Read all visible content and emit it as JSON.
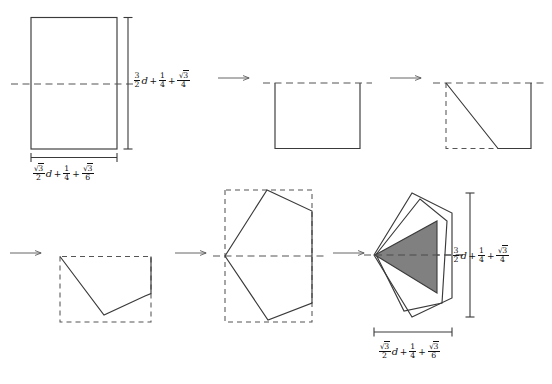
{
  "figure": {
    "domain": "diagram",
    "background_color": "#ffffff",
    "stroke_color": "#3a3a3a",
    "dashed_color": "#555555",
    "shade_color": "#808080",
    "arrow_color": "#555555",
    "step_count": 6
  },
  "labels": {
    "height_label": {
      "name": "height-dimension-label",
      "text": "3/2 d + 1/4 + sqrt(3)/4",
      "parts": {
        "f1_num": "3",
        "f1_den": "2",
        "var": "d",
        "op1": "+",
        "f2_num": "1",
        "f2_den": "4",
        "op2": "+",
        "f3_num_radical": "3",
        "f3_den": "4"
      }
    },
    "width_label": {
      "name": "width-dimension-label",
      "text": "sqrt(3)/2 d + 1/4 + sqrt(3)/6",
      "parts": {
        "f1_num_radical": "3",
        "f1_den": "2",
        "var": "d",
        "op1": "+",
        "f2_num": "1",
        "f2_den": "4",
        "op2": "+",
        "f3_num_radical": "3",
        "f3_den": "6"
      }
    }
  },
  "glyphs": {
    "radical": "√",
    "plus": "+",
    "arrow": "→"
  },
  "steps": [
    {
      "index": 1,
      "name": "step-1-rectangle",
      "shape": "rectangle",
      "has_height_dimension": true,
      "has_width_dimension": true,
      "has_axis": true
    },
    {
      "index": 2,
      "name": "step-2-lower-half",
      "shape": "open-rectangle",
      "has_axis": true
    },
    {
      "index": 3,
      "name": "step-3-first-diagonal-cut",
      "shape": "trapezoid",
      "has_axis": true
    },
    {
      "index": 4,
      "name": "step-4-second-diagonal-cut",
      "shape": "notched-polygon",
      "has_axis": true
    },
    {
      "index": 5,
      "name": "step-5-unfolded-pentagon",
      "shape": "pentagon",
      "has_axis": true
    },
    {
      "index": 6,
      "name": "step-6-nested-pentagons-with-triangle",
      "shape": "nested-pentagons",
      "shaded": true,
      "has_height_dimension": true,
      "has_width_dimension": true,
      "has_axis": true
    }
  ],
  "arrows": [
    {
      "name": "arrow-step-1-to-2",
      "x1": 218,
      "y1": 78,
      "x2": 249,
      "y2": 78
    },
    {
      "name": "arrow-step-2-to-3",
      "x1": 390,
      "y1": 78,
      "x2": 421,
      "y2": 78
    },
    {
      "name": "arrow-step-3-to-4",
      "x1": 10,
      "y1": 253,
      "x2": 41,
      "y2": 253
    },
    {
      "name": "arrow-step-4-to-5",
      "x1": 175,
      "y1": 253,
      "x2": 206,
      "y2": 253
    },
    {
      "name": "arrow-step-5-to-6",
      "x1": 333,
      "y1": 253,
      "x2": 364,
      "y2": 253
    }
  ]
}
